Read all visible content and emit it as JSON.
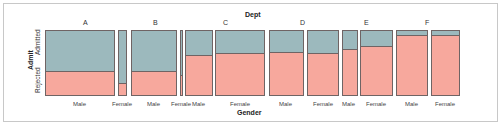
{
  "chart_data": {
    "type": "mosaic",
    "title_top": "Dept",
    "xlabel": "Gender",
    "ylabel": "Admit",
    "y_levels": [
      "Admitted",
      "Rejected"
    ],
    "departments": [
      "A",
      "B",
      "C",
      "D",
      "E",
      "F"
    ],
    "gender_levels": [
      "Male",
      "Female"
    ],
    "colors": {
      "Admitted": "#9cb9bd",
      "Rejected": "#f7a89d",
      "border": "#6f6464"
    },
    "cells": [
      {
        "dept": "A",
        "gender": "Male",
        "x": 45,
        "w": 70,
        "admitted_frac": 0.62
      },
      {
        "dept": "A",
        "gender": "Female",
        "x": 118,
        "w": 9,
        "admitted_frac": 0.82
      },
      {
        "dept": "B",
        "gender": "Male",
        "x": 131,
        "w": 46,
        "admitted_frac": 0.63
      },
      {
        "dept": "B",
        "gender": "Female",
        "x": 180,
        "w": 3,
        "admitted_frac": 0.68
      },
      {
        "dept": "C",
        "gender": "Male",
        "x": 185,
        "w": 28,
        "admitted_frac": 0.37
      },
      {
        "dept": "C",
        "gender": "Female",
        "x": 215,
        "w": 50,
        "admitted_frac": 0.34
      },
      {
        "dept": "D",
        "gender": "Male",
        "x": 269,
        "w": 35,
        "admitted_frac": 0.33
      },
      {
        "dept": "D",
        "gender": "Female",
        "x": 307,
        "w": 32,
        "admitted_frac": 0.35
      },
      {
        "dept": "E",
        "gender": "Male",
        "x": 342,
        "w": 16,
        "admitted_frac": 0.28
      },
      {
        "dept": "E",
        "gender": "Female",
        "x": 360,
        "w": 33,
        "admitted_frac": 0.24
      },
      {
        "dept": "F",
        "gender": "Male",
        "x": 396,
        "w": 32,
        "admitted_frac": 0.06
      },
      {
        "dept": "F",
        "gender": "Female",
        "x": 431,
        "w": 29,
        "admitted_frac": 0.07
      }
    ],
    "dept_label_x": {
      "A": 86,
      "B": 156,
      "C": 226,
      "D": 303,
      "E": 367,
      "F": 428
    },
    "gender_label_x": [
      80,
      122,
      154,
      181,
      199,
      240,
      286,
      323,
      349,
      376,
      412,
      445
    ],
    "plot_top": 30,
    "plot_height": 66
  }
}
